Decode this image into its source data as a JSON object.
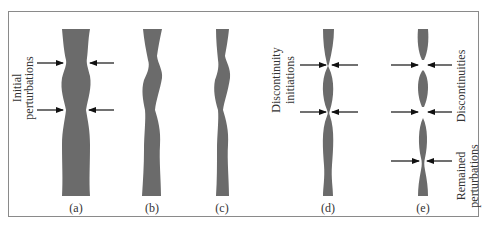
{
  "figure": {
    "panels": [
      {
        "id": "a",
        "label": "(a)"
      },
      {
        "id": "b",
        "label": "(b)"
      },
      {
        "id": "c",
        "label": "(c)"
      },
      {
        "id": "d",
        "label": "(d)"
      },
      {
        "id": "e",
        "label": "(e)"
      }
    ],
    "annotations": {
      "initial_line1": "Initial",
      "initial_line2": "perturbations",
      "disc_init_line1": "Discontinuity",
      "disc_init_line2": "initiations",
      "discontinuities": "Discontinuities",
      "remained_line1": "Remained",
      "remained_line2": "perturbations"
    },
    "colors": {
      "strand": "#6b6b6b",
      "arrow": "#111111",
      "frame": "#8a8a8a",
      "text": "#333333"
    }
  }
}
